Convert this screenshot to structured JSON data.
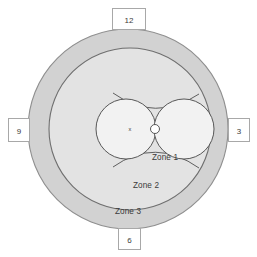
{
  "figure": {
    "type": "concentric-zone-diagram",
    "title": "",
    "background_color": "#ffffff"
  },
  "zones": [
    {
      "id": "zone1",
      "label": "Zone 1",
      "fill": "#f2f2f2",
      "stroke": "#555555",
      "label_x": 132,
      "label_y": 158,
      "description": "innermost region formed by two tangent circles"
    },
    {
      "id": "zone2",
      "label": "Zone 2",
      "fill": "#e3e3e3",
      "stroke": "#6a6a6a",
      "label_x": 128,
      "label_y": 185,
      "description": "middle ring",
      "radius": 81
    },
    {
      "id": "zone3",
      "label": "Zone 3",
      "fill": "#d2d2d2",
      "stroke": "#8a8a8a",
      "label_x": 120,
      "label_y": 211,
      "description": "outermost ring",
      "radius": 100
    }
  ],
  "center_marker": {
    "label": "x",
    "label_x": 130,
    "label_y": 131,
    "node_x": 155,
    "node_y": 129,
    "node_radius": 4.5,
    "node_fill": "#ffffff",
    "node_stroke": "#555555"
  },
  "lobes": [
    {
      "id": "lobe-left",
      "cx": 126,
      "cy": 129,
      "r": 30
    },
    {
      "id": "lobe-right",
      "cx": 184,
      "cy": 129,
      "r": 30
    }
  ],
  "crossing_arcs": [
    {
      "id": "arc-upper",
      "d": "M 115 94 Q 155 122 197 95"
    },
    {
      "id": "arc-lower",
      "d": "M 115 166 Q 155 138 197 167"
    }
  ],
  "clock_labels": [
    {
      "id": "clock-12",
      "value": "12",
      "box_x": 112,
      "box_y": 8,
      "box_w": 33,
      "box_h": 21
    },
    {
      "id": "clock-3",
      "value": "3",
      "box_x": 228,
      "box_y": 118,
      "box_w": 22,
      "box_h": 23
    },
    {
      "id": "clock-6",
      "value": "6",
      "box_x": 118,
      "box_y": 228,
      "box_w": 22,
      "box_h": 21
    },
    {
      "id": "clock-9",
      "value": "9",
      "box_x": 8,
      "box_y": 118,
      "box_w": 22,
      "box_h": 23
    }
  ],
  "colors": {
    "outer_ring": "#d2d2d2",
    "middle_ring": "#e3e3e3",
    "inner_fill": "#f2f2f2",
    "text": "#3b3b3b",
    "box_border": "#a8a8a8",
    "page_background": "#ffffff"
  }
}
